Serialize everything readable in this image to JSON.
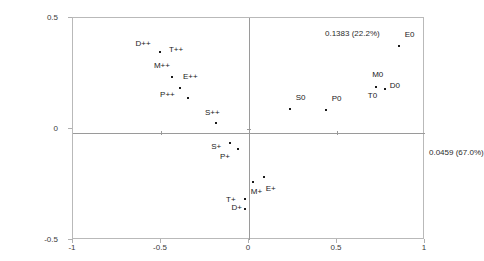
{
  "chart_data": {
    "type": "scatter",
    "title": "",
    "xlabel": "0.0459 (67.0%)",
    "ylabel": "0.1383 (22.2%)",
    "xlim": [
      -1,
      1
    ],
    "ylim": [
      -0.5,
      0.5
    ],
    "grid": false,
    "legend": "none",
    "x_ticks": [
      "-1",
      "-0.5",
      "0",
      "0.5",
      "1"
    ],
    "x_tick_values": [
      -1,
      -0.5,
      0,
      0.5,
      1
    ],
    "y_ticks": [
      "0.5",
      "0",
      "-0.5"
    ],
    "y_tick_values": [
      0.5,
      0,
      -0.5
    ],
    "annotations": {
      "y_axis_label": "0.1383 (22.2%)",
      "x_axis_label": "0.0459 (67.0%)"
    },
    "points": [
      {
        "label": "D++",
        "x": -0.505,
        "y": 0.345,
        "lx": -0.645,
        "ly": 0.385
      },
      {
        "label": "T++",
        "x": -0.505,
        "y": 0.345,
        "lx": -0.455,
        "ly": 0.355
      },
      {
        "label": "M++",
        "x": -0.435,
        "y": 0.235,
        "lx": -0.54,
        "ly": 0.285
      },
      {
        "label": "E++",
        "x": -0.39,
        "y": 0.185,
        "lx": -0.375,
        "ly": 0.235
      },
      {
        "label": "P++",
        "x": -0.345,
        "y": 0.14,
        "lx": -0.505,
        "ly": 0.155
      },
      {
        "label": "S++",
        "x": -0.185,
        "y": 0.025,
        "lx": -0.25,
        "ly": 0.07
      },
      {
        "label": "S+",
        "x": -0.11,
        "y": -0.065,
        "lx": -0.215,
        "ly": -0.08
      },
      {
        "label": "P+",
        "x": -0.06,
        "y": -0.09,
        "lx": -0.165,
        "ly": -0.125
      },
      {
        "label": "M+",
        "x": 0.025,
        "y": -0.24,
        "lx": 0.01,
        "ly": -0.285
      },
      {
        "label": "E+",
        "x": 0.085,
        "y": -0.215,
        "lx": 0.095,
        "ly": -0.27
      },
      {
        "label": "T+",
        "x": -0.02,
        "y": -0.315,
        "lx": -0.13,
        "ly": -0.32
      },
      {
        "label": "D+",
        "x": -0.02,
        "y": -0.36,
        "lx": -0.1,
        "ly": -0.355
      },
      {
        "label": "S0",
        "x": 0.235,
        "y": 0.09,
        "lx": 0.265,
        "ly": 0.14
      },
      {
        "label": "P0",
        "x": 0.44,
        "y": 0.085,
        "lx": 0.47,
        "ly": 0.135
      },
      {
        "label": "M0",
        "x": 0.72,
        "y": 0.19,
        "lx": 0.7,
        "ly": 0.245
      },
      {
        "label": "T0",
        "x": 0.72,
        "y": 0.19,
        "lx": 0.675,
        "ly": 0.15
      },
      {
        "label": "D0",
        "x": 0.775,
        "y": 0.18,
        "lx": 0.8,
        "ly": 0.195
      },
      {
        "label": "E0",
        "x": 0.855,
        "y": 0.375,
        "lx": 0.885,
        "ly": 0.425
      }
    ]
  }
}
